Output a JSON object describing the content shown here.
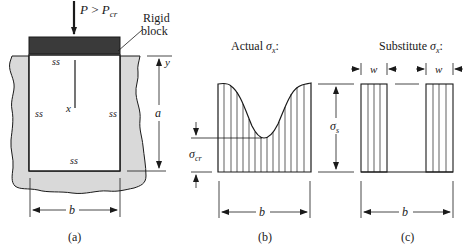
{
  "figure": {
    "panel_a": {
      "caption": "(a)",
      "load_label_P": "P",
      "load_label_rel": " > ",
      "load_label_Pcr": "P",
      "load_label_cr_sub": "cr",
      "rigid_block_label_line1": "Rigid",
      "rigid_block_label_line2": "block",
      "edge_top": "ss",
      "edge_left": "ss",
      "edge_right": "ss",
      "edge_bottom": "ss",
      "axis_x": "x",
      "axis_y": "y",
      "dim_a": "a",
      "dim_b": "b"
    },
    "panel_b": {
      "caption": "(b)",
      "title_prefix": "Actual ",
      "title_sigma": "σ",
      "title_sub": "x",
      "title_suffix": ":",
      "sigma_cr": "σ",
      "sigma_cr_sub": "cr",
      "dim_b": "b"
    },
    "panel_c": {
      "caption": "(c)",
      "title_prefix": "Substitute ",
      "title_sigma": "σ",
      "title_sub": "x",
      "title_suffix": ":",
      "sigma_s": "σ",
      "sigma_s_sub": "s",
      "dim_w_left": "w",
      "dim_w_right": "w",
      "dim_b": "b"
    }
  },
  "colors": {
    "ink": "#1a1a1a",
    "wall_fill": "#d9d9d9",
    "rigid_block": "#3a3a3a"
  }
}
